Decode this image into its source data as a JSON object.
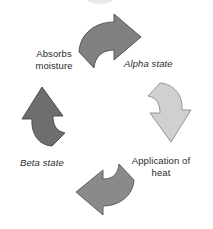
{
  "diagram": {
    "type": "cycle",
    "direction": "clockwise",
    "background_color": "#ffffff",
    "text_color": "#2b2b2b",
    "steps": [
      {
        "id": "alpha-state",
        "label": "Alpha state",
        "style": "italic",
        "position": "right",
        "arrow": {
          "name": "top-arrow",
          "points": "right",
          "color": "#808080",
          "outline_color": "#4d4d4d"
        }
      },
      {
        "id": "application-of-heat",
        "label": "Application of\nheat",
        "style": "roman",
        "position": "bottom-right",
        "arrow": {
          "name": "right-arrow",
          "points": "down",
          "color": "#d0d0d0",
          "outline_color": "#8c8c8c"
        }
      },
      {
        "id": "beta-state",
        "label": "Beta state",
        "style": "italic",
        "position": "bottom-left",
        "arrow": {
          "name": "bottom-arrow",
          "points": "left",
          "color": "#8a8a8a",
          "outline_color": "#555555"
        }
      },
      {
        "id": "absorbs-moisture",
        "label": "Absorbs\nmoisture",
        "style": "roman",
        "position": "top-left",
        "arrow": {
          "name": "left-arrow",
          "points": "up",
          "color": "#6e6e6e",
          "outline_color": "#464646"
        }
      }
    ],
    "top_fragment": {
      "name": "cropped-shape-fragment",
      "color": "#d9d9d9"
    }
  }
}
